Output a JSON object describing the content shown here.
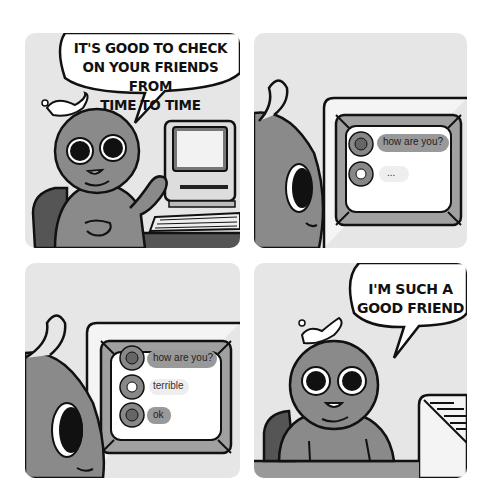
{
  "comic": {
    "panels": [
      {
        "id": 1,
        "speech": [
          "IT'S GOOD TO CHECK",
          "ON YOUR FRIENDS FROM",
          "TIME TO TIME"
        ],
        "scene": "character-waving-at-computer"
      },
      {
        "id": 2,
        "scene": "character-looking-at-chat-screen",
        "chat": [
          {
            "sender": "friend",
            "avatar": "bear-avatar",
            "text": "how are you?",
            "style": "dark"
          },
          {
            "sender": "other",
            "avatar": "egg-avatar",
            "text": "...",
            "style": "light"
          }
        ]
      },
      {
        "id": 3,
        "scene": "character-looking-at-chat-screen",
        "chat": [
          {
            "sender": "friend",
            "avatar": "bear-avatar",
            "text": "how are you?",
            "style": "dark"
          },
          {
            "sender": "other",
            "avatar": "egg-avatar",
            "text": "terrible",
            "style": "light"
          },
          {
            "sender": "friend",
            "avatar": "bear-avatar",
            "text": "ok",
            "style": "dark"
          }
        ]
      },
      {
        "id": 4,
        "speech": [
          "I'M SUCH A",
          "GOOD FRIEND"
        ],
        "scene": "character-smiling-proudly"
      }
    ]
  },
  "colors": {
    "panel_bg": "#e6e6e6",
    "character": "#8a8a8a",
    "outline": "#111111",
    "chair": "#555555",
    "bubble_dark": "#999999",
    "bubble_light": "#eeeeee",
    "screen_frame": "#a0a0a0"
  }
}
